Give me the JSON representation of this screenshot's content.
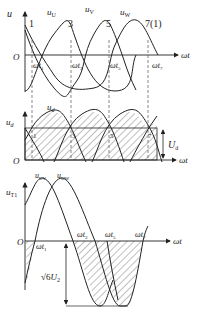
{
  "diagram": {
    "top_plot": {
      "y_axis_label": "u",
      "x_axis_label": "ωt",
      "origin_label": "O",
      "curves": [
        "u_U",
        "u_V",
        "u_W"
      ],
      "curve_labels": {
        "uU": "u",
        "uU_sub": "U",
        "uV": "u",
        "uV_sub": "V",
        "uW": "u",
        "uW_sub": "W"
      },
      "commutation_points": [
        "1",
        "3",
        "5",
        "7(1)"
      ],
      "time_marks": [
        {
          "base": "ωt",
          "sub": "1"
        },
        {
          "base": "ωt",
          "sub": "3"
        },
        {
          "base": "ωt",
          "sub": "5"
        },
        {
          "base": "ωt",
          "sub": "7"
        }
      ]
    },
    "middle_plot": {
      "y_axis_label": "u",
      "y_axis_sub": "d",
      "x_axis_label": "ωt",
      "origin_label": "O",
      "curve_label": "u",
      "curve_sub": "d",
      "points": [
        "1",
        "3",
        "5",
        "7"
      ],
      "avg_label": "U",
      "avg_sub": "d"
    },
    "bottom_plot": {
      "y_axis_label": "u",
      "y_axis_sub": "T1",
      "x_axis_label": "ωt",
      "origin_label": "O",
      "curve_labels": [
        {
          "base": "u",
          "sub": "UV"
        },
        {
          "base": "u",
          "sub": "UW"
        }
      ],
      "time_marks": [
        {
          "base": "ωt",
          "sub": "1"
        },
        {
          "base": "ωt",
          "sub": "3"
        },
        {
          "base": "ωt",
          "sub": "5"
        },
        {
          "base": "ωt",
          "sub": "7"
        }
      ],
      "peak_label": "√6",
      "peak_label_tail": "U",
      "peak_label_sub": "2"
    }
  }
}
